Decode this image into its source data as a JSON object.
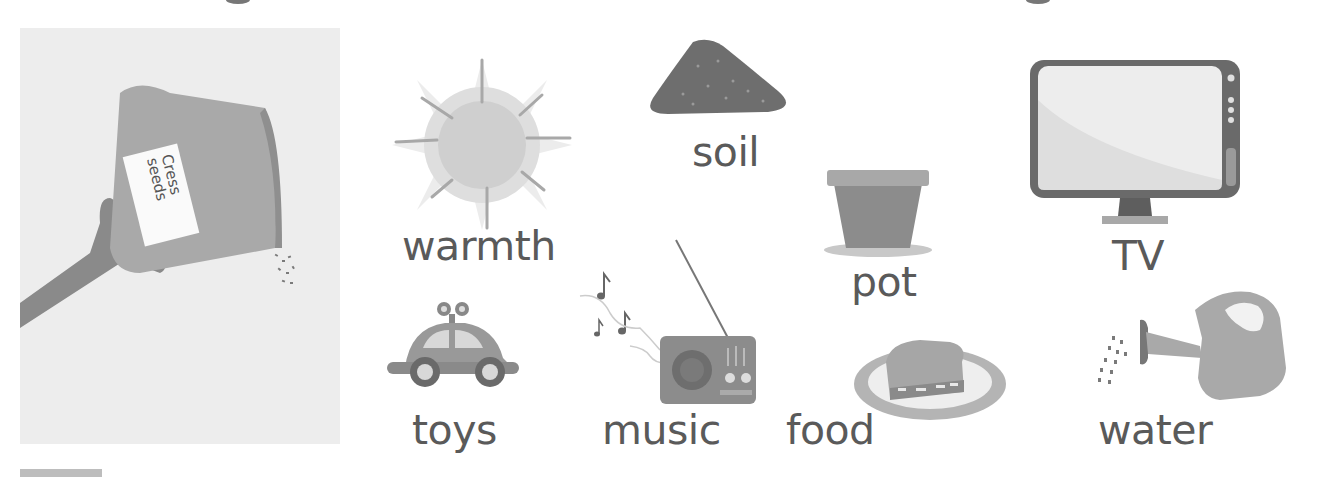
{
  "worksheet": {
    "seed_packet": {
      "label_line1": "Cress",
      "label_line2": "seeds"
    },
    "items": [
      {
        "id": "warmth",
        "label": "warmth",
        "icon": "sun-icon"
      },
      {
        "id": "soil",
        "label": "soil",
        "icon": "soil-pile-icon"
      },
      {
        "id": "pot",
        "label": "pot",
        "icon": "flower-pot-icon"
      },
      {
        "id": "tv",
        "label": "TV",
        "icon": "television-icon"
      },
      {
        "id": "toys",
        "label": "toys",
        "icon": "toy-car-icon"
      },
      {
        "id": "music",
        "label": "music",
        "icon": "radio-icon"
      },
      {
        "id": "food",
        "label": "food",
        "icon": "sandwich-icon"
      },
      {
        "id": "water",
        "label": "water",
        "icon": "watering-can-icon"
      }
    ],
    "colors": {
      "ink": "#5a5a5a",
      "dark_fill": "#6e6e6e",
      "mid_fill": "#9a9a9a",
      "light_fill": "#c8c8c8",
      "panel_bg": "#ededed"
    }
  }
}
